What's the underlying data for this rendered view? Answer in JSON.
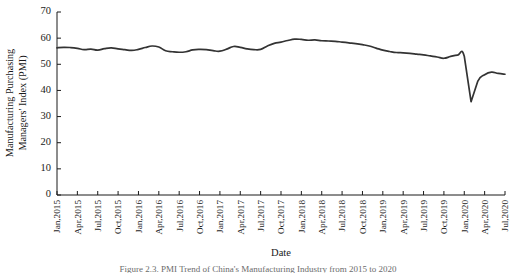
{
  "chart_data": {
    "type": "line",
    "title": "",
    "xlabel": "Date",
    "ylabel": "Manufacturing Purchasing Managers' Index (PMI)",
    "ylabel_line1": "Manufacturing Purchasing",
    "ylabel_line2": "Managers' Index (PMI)",
    "ylim": [
      0,
      70
    ],
    "yticks": [
      0,
      10,
      20,
      30,
      40,
      50,
      60,
      70
    ],
    "grid": false,
    "legend": false,
    "line_color": "#333333",
    "series_name": "Manufacturing PMI",
    "xtick_labels": [
      "Jan,2015",
      "Apr,2015",
      "Jul,2015",
      "Oct,2015",
      "Jan,2016",
      "Apr,2016",
      "Jul,2016",
      "Oct,2016",
      "Jan,2017",
      "Apr,2017",
      "Jul,2017",
      "Oct,2017",
      "Jan,2018",
      "Apr,2018",
      "Jul,2018",
      "Oct,2018",
      "Jan,2019",
      "Apr,2019",
      "Jul,2019",
      "Oct,2019",
      "Jan,2020",
      "Apr,2020",
      "Jul,2020"
    ],
    "x": [
      "Jan,2015",
      "Feb,2015",
      "Mar,2015",
      "Apr,2015",
      "May,2015",
      "Jun,2015",
      "Jul,2015",
      "Aug,2015",
      "Sep,2015",
      "Oct,2015",
      "Nov,2015",
      "Dec,2015",
      "Jan,2016",
      "Feb,2016",
      "Mar,2016",
      "Apr,2016",
      "May,2016",
      "Jun,2016",
      "Jul,2016",
      "Aug,2016",
      "Sep,2016",
      "Oct,2016",
      "Nov,2016",
      "Dec,2016",
      "Jan,2017",
      "Feb,2017",
      "Mar,2017",
      "Apr,2017",
      "May,2017",
      "Jun,2017",
      "Jul,2017",
      "Aug,2017",
      "Sep,2017",
      "Oct,2017",
      "Nov,2017",
      "Dec,2017",
      "Jan,2018",
      "Feb,2018",
      "Mar,2018",
      "Apr,2018",
      "May,2018",
      "Jun,2018",
      "Jul,2018",
      "Aug,2018",
      "Sep,2018",
      "Oct,2018",
      "Nov,2018",
      "Dec,2018",
      "Jan,2019",
      "Feb,2019",
      "Mar,2019",
      "Apr,2019",
      "May,2019",
      "Jun,2019",
      "Jul,2019",
      "Aug,2019",
      "Sep,2019",
      "Oct,2019",
      "Nov,2019",
      "Dec,2019",
      "Jan,2020",
      "Feb,2020",
      "Mar,2020",
      "Apr,2020",
      "May,2020",
      "Jun,2020",
      "Jul,2020"
    ],
    "values": [
      56.3,
      56.5,
      56.4,
      56.1,
      55.6,
      55.8,
      55.4,
      56.0,
      56.3,
      55.9,
      55.6,
      55.3,
      55.7,
      56.4,
      57.0,
      56.6,
      55.2,
      54.8,
      54.6,
      54.8,
      55.5,
      55.7,
      55.6,
      55.2,
      55.0,
      55.8,
      56.8,
      56.5,
      55.9,
      55.6,
      55.7,
      57.0,
      58.0,
      58.5,
      59.1,
      59.6,
      59.5,
      59.2,
      59.3,
      59.0,
      58.9,
      58.8,
      58.5,
      58.2,
      57.9,
      57.5,
      57.0,
      56.2,
      55.4,
      54.9,
      54.5,
      54.4,
      54.2,
      53.9,
      53.6,
      53.2,
      52.8,
      52.3,
      53.0,
      53.5,
      53.1,
      35.7,
      43.6,
      46.0,
      47.0,
      46.5,
      46.2
    ]
  },
  "caption": {
    "text": "Figure 2.3. PMI Trend of China's Manufacturing Industry from 2015 to 2020"
  }
}
